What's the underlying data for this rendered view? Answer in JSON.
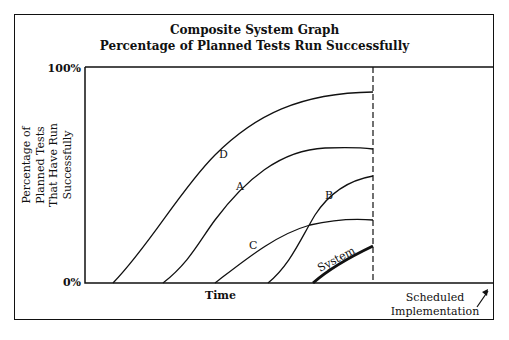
{
  "title": {
    "line1": "Composite System Graph",
    "line2": "Percentage of Planned Tests Run Successfully"
  },
  "y_axis": {
    "label_line1": "Percentage of",
    "label_line2": "Planned Tests",
    "label_line3": "That Have Run",
    "label_line4": "Successfully",
    "tick_top": "100%",
    "tick_bottom": "0%"
  },
  "x_axis": {
    "label": "Time"
  },
  "annotation": {
    "line1": "Scheduled",
    "line2": "Implementation",
    "arrow": "arrow-up-right-icon"
  },
  "curves": {
    "D": "D",
    "A": "A",
    "B": "B",
    "C": "C",
    "system": "System"
  },
  "colors": {
    "line": "#111111",
    "background": "#ffffff"
  }
}
